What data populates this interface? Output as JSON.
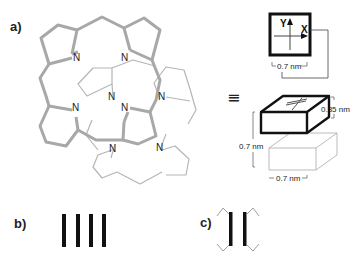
{
  "panels": {
    "a": {
      "label": "a)"
    },
    "b": {
      "label": "b)"
    },
    "c": {
      "label": "c)"
    }
  },
  "molecule": {
    "atom_label": "N",
    "top_layer_color": "#aaaaaa",
    "bottom_layer_color": "#b8b8b8"
  },
  "equivalence_symbol": "≡",
  "top_view": {
    "axis_y": "Y",
    "axis_x": "X",
    "width_label": "0.7 nm"
  },
  "block_view": {
    "thickness_label": "0.35 nm",
    "height_label": "0.7 nm",
    "width_label": "0.7 nm"
  }
}
